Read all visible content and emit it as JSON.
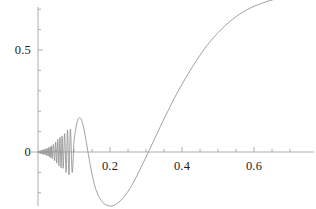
{
  "chart_data": {
    "type": "line",
    "title": "",
    "subtitle": "",
    "xlabel": "",
    "ylabel": "",
    "xlim": [
      -0.02,
      0.735
    ],
    "ylim": [
      -0.265,
      0.78
    ],
    "grid": false,
    "legend": null,
    "axes": {
      "x_axis_y_value": 0,
      "y_axis_x_value": 0,
      "x_major_ticks": [
        0.2,
        0.4,
        0.6
      ],
      "x_major_tick_labels": [
        "0.2",
        "0.4",
        "0.6"
      ],
      "x_minor_tick_step": 0.05,
      "y_major_ticks": [
        0,
        0.5
      ],
      "y_major_tick_labels": [
        "0",
        "0.5"
      ],
      "y_minor_tick_step": 0.1
    },
    "series": [
      {
        "name": "chirp",
        "color": "#8a8a8a",
        "linewidth": 0.8,
        "description": "damped high-frequency chirp near x=0 growing in period, deep minimum near x=0.24, then monotone rise",
        "x": [
          0.0,
          0.002,
          0.004,
          0.006,
          0.008,
          0.01,
          0.012,
          0.014,
          0.016,
          0.018,
          0.02,
          0.022,
          0.024,
          0.026,
          0.028,
          0.03,
          0.032,
          0.034,
          0.036,
          0.038,
          0.04,
          0.043,
          0.046,
          0.049,
          0.052,
          0.055,
          0.058,
          0.061,
          0.064,
          0.067,
          0.07,
          0.074,
          0.078,
          0.082,
          0.086,
          0.09,
          0.095,
          0.1,
          0.105,
          0.11,
          0.115,
          0.12,
          0.125,
          0.13,
          0.135,
          0.14,
          0.145,
          0.15,
          0.155,
          0.16,
          0.17,
          0.18,
          0.19,
          0.2,
          0.21,
          0.22,
          0.23,
          0.24,
          0.25,
          0.26,
          0.27,
          0.28,
          0.29,
          0.3,
          0.31,
          0.32,
          0.33,
          0.34,
          0.35,
          0.36,
          0.38,
          0.4,
          0.42,
          0.44,
          0.46,
          0.48,
          0.5,
          0.52,
          0.54,
          0.56,
          0.58,
          0.6,
          0.62,
          0.64,
          0.66,
          0.68,
          0.7,
          0.72
        ],
        "y": [
          0.0,
          0.004,
          -0.006,
          0.007,
          -0.009,
          0.009,
          -0.011,
          0.012,
          -0.012,
          0.013,
          -0.014,
          0.016,
          -0.017,
          0.018,
          -0.02,
          0.022,
          -0.024,
          0.026,
          -0.028,
          0.03,
          -0.033,
          0.038,
          -0.043,
          0.049,
          -0.055,
          0.062,
          -0.068,
          0.073,
          -0.077,
          0.079,
          -0.08,
          0.09,
          -0.1,
          0.108,
          -0.112,
          0.112,
          -0.1,
          0.05,
          0.115,
          0.155,
          0.168,
          0.16,
          0.132,
          0.09,
          0.04,
          -0.012,
          -0.062,
          -0.108,
          -0.148,
          -0.18,
          -0.222,
          -0.248,
          -0.26,
          -0.265,
          -0.262,
          -0.252,
          -0.238,
          -0.218,
          -0.193,
          -0.165,
          -0.133,
          -0.098,
          -0.062,
          -0.025,
          0.012,
          0.05,
          0.088,
          0.125,
          0.162,
          0.198,
          0.268,
          0.332,
          0.392,
          0.448,
          0.5,
          0.545,
          0.585,
          0.62,
          0.65,
          0.676,
          0.697,
          0.714,
          0.728,
          0.74,
          0.75,
          0.757,
          0.763,
          0.768
        ]
      }
    ]
  },
  "y_tick_labels": [
    {
      "text": "0.5",
      "value": 0.5
    },
    {
      "text": "0",
      "value": 0
    }
  ],
  "x_tick_labels": [
    {
      "text": "0.2",
      "value": 0.2
    },
    {
      "text": "0.4",
      "value": 0.4
    },
    {
      "text": "0.6",
      "value": 0.6
    }
  ],
  "colors": {
    "curve": "#8a8a8a",
    "axis": "#9a9a9a",
    "text": "#1a1a1a",
    "background": "#ffffff"
  }
}
